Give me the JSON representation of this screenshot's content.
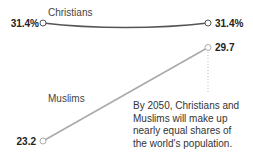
{
  "chart_data": {
    "type": "line",
    "title": "",
    "xlabel": "",
    "ylabel": "",
    "x": [
      "start",
      "2050"
    ],
    "ylim": [
      23.2,
      31.4
    ],
    "series": [
      {
        "name": "Christians",
        "values": [
          31.4,
          31.4
        ],
        "start_label": "31.4%",
        "end_label": "31.4%",
        "color": "#555555"
      },
      {
        "name": "Muslims",
        "values": [
          23.2,
          29.7
        ],
        "start_label": "23.2",
        "end_label": "29.7",
        "color": "#aaaaaa"
      }
    ],
    "annotation": [
      "By 2050, Christians and",
      "Muslims will make up",
      "nearly equal shares of",
      "the world's population."
    ]
  }
}
